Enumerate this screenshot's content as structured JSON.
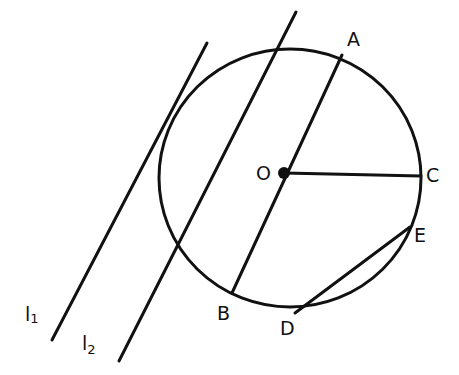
{
  "diagram": {
    "type": "geometry-circle-lines",
    "center_label": "O",
    "points": [
      {
        "name": "A",
        "x": 342,
        "y": 55
      },
      {
        "name": "B",
        "x": 232,
        "y": 293
      },
      {
        "name": "C",
        "x": 421,
        "y": 176
      },
      {
        "name": "D",
        "x": 295,
        "y": 313
      },
      {
        "name": "E",
        "x": 410,
        "y": 227
      }
    ],
    "segments": [
      {
        "from": "A",
        "to": "B",
        "desc": "diameter through O"
      },
      {
        "from": "O",
        "to": "C",
        "desc": "radius"
      },
      {
        "from": "D",
        "to": "E",
        "desc": "chord"
      }
    ],
    "lines": [
      {
        "name": "l1",
        "label_main": "l",
        "label_sub": "1",
        "desc": "tangent line"
      },
      {
        "name": "l2",
        "label_main": "l",
        "label_sub": "2",
        "desc": "secant line"
      }
    ],
    "labels": {
      "O": "O",
      "A": "A",
      "B": "B",
      "C": "C",
      "D": "D",
      "E": "E",
      "l1_main": "l",
      "l1_sub": "1",
      "l2_main": "l",
      "l2_sub": "2"
    }
  }
}
